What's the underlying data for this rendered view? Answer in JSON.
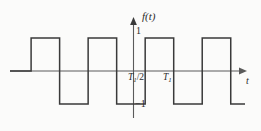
{
  "figure": {
    "title": "",
    "background_color": "#fbfbfa",
    "line_color": "#3a3a3a",
    "axis_color": "#555555",
    "text_color": "#2b2b2b"
  },
  "labels": {
    "y_axis": "f(t)",
    "y_axis_function_letter": "f",
    "y_axis_arg": "(t)",
    "x_axis": "t",
    "amplitude_positive": "1",
    "amplitude_negative": "−1",
    "half_period_main": "T",
    "half_period_sub": "1",
    "half_period_tail": "/2",
    "period_main": "T",
    "period_sub": "1"
  },
  "chart_data": {
    "type": "line",
    "title": "",
    "xlabel": "t",
    "ylabel": "f(t)",
    "xlim": [
      -2.12,
      2.0
    ],
    "ylim": [
      -1.45,
      1.45
    ],
    "grid": false,
    "legend": null,
    "amplitude": 1,
    "period": 1,
    "duty_cycle": 0.5,
    "x_tick_labels": [
      "T1/2",
      "T1"
    ],
    "x_tick_values": [
      0.5,
      1.0
    ],
    "y_tick_labels": [
      "1",
      "-1"
    ],
    "y_tick_values": [
      1,
      -1
    ],
    "series": [
      {
        "name": "f(t)",
        "x": [
          -2.12,
          -1.75,
          -1.75,
          -1.25,
          -1.25,
          -0.75,
          -0.75,
          -0.25,
          -0.25,
          0.25,
          0.25,
          0.75,
          0.75,
          1.25,
          1.25,
          1.75,
          1.75,
          2.0
        ],
        "y": [
          0,
          0,
          1,
          1,
          -1,
          -1,
          1,
          1,
          -1,
          -1,
          1,
          1,
          -1,
          -1,
          1,
          1,
          -1,
          -1
        ]
      }
    ]
  },
  "geometry": {
    "axis_y_px": 71,
    "axis_x_px": 133,
    "top_level_px": 38,
    "bottom_level_px": 104,
    "edges_px": [
      34,
      57,
      80,
      103,
      133,
      156,
      179,
      202,
      225
    ],
    "x_axis_start_px": 10,
    "x_axis_end_px": 245,
    "y_axis_top_px": 19,
    "y_axis_bottom_px": 118
  }
}
